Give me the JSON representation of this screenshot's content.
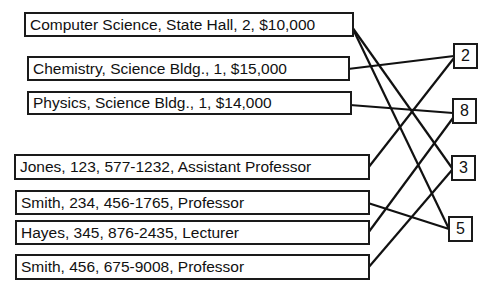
{
  "departments": [
    {
      "label": "Computer Science, State Hall, 2, $10,000",
      "links_to": [
        "3",
        "5"
      ]
    },
    {
      "label": "Chemistry, Science Bldg., 1, $15,000",
      "links_to": [
        "2"
      ]
    },
    {
      "label": "Physics, Science Bldg., 1, $14,000",
      "links_to": [
        "8"
      ]
    }
  ],
  "faculty": [
    {
      "label": "Jones, 123, 577-1232, Assistant Professor",
      "links_to": [
        "2"
      ]
    },
    {
      "label": "Smith, 234, 456-1765, Professor",
      "links_to": [
        "5"
      ]
    },
    {
      "label": "Hayes, 345, 876-2435, Lecturer",
      "links_to": [
        "8"
      ]
    },
    {
      "label": "Smith, 456, 675-9008, Professor",
      "links_to": [
        "3"
      ]
    }
  ],
  "pointers": [
    {
      "label": "2"
    },
    {
      "label": "8"
    },
    {
      "label": "3"
    },
    {
      "label": "5"
    }
  ]
}
